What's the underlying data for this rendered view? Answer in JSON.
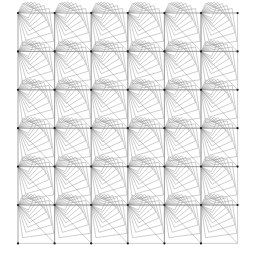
{
  "artwork": {
    "title": "Nested Square Spiral Tiling",
    "canvas": {
      "width": 255,
      "height": 260,
      "background_color": "#ffffff"
    },
    "stroke": {
      "color": "#8c8c8c",
      "width": 0.45,
      "opacity": 0.95
    },
    "grid": {
      "columns": 6,
      "rows": 6,
      "origin_x": 18,
      "origin_y": 13,
      "cell_width": 36.6,
      "cell_height": 38.4
    },
    "spiral": {
      "turns": 9,
      "shrink_factor": 0.86,
      "rotation_per_turn_deg": -8,
      "convergence_corner": "top-left",
      "direction": "counterclockwise"
    },
    "vertices": {
      "marker_color": "#1a1a1a",
      "marker_radius": 1.1,
      "description": "dark convergence nodes at spiral centers"
    }
  }
}
